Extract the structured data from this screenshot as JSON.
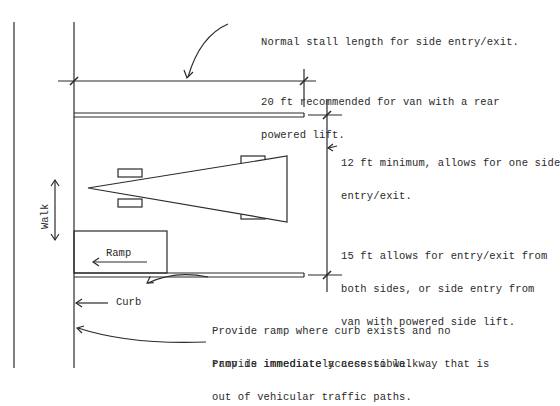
{
  "diagram": {
    "stall_length_note": {
      "line1": "Normal stall length for side entry/exit.",
      "line2": "20 ft recommended for van with a rear",
      "line3": "powered lift."
    },
    "stall_width_note": {
      "line1": "12 ft minimum, allows for one side",
      "line2": "entry/exit.",
      "line3": "15 ft allows for entry/exit from",
      "line4": "both sides, or side entry from",
      "line5": "van with powered side lift."
    },
    "ramp_note": {
      "line1": "Provide ramp where curb exists and no",
      "line2": "ramp is immediately accessible."
    },
    "walkway_note": {
      "line1": "Provide immediate access to walkway that is",
      "line2": "out of vehicular traffic paths."
    },
    "labels": {
      "walk": "Walk",
      "ramp": "Ramp",
      "curb": "Curb"
    },
    "colors": {
      "line": "#2a2a2a",
      "background": "#ffffff"
    }
  }
}
